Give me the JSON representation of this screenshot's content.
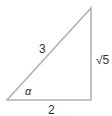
{
  "diagram": {
    "type": "right-triangle",
    "line_color": "#b3b3b3",
    "text_color": "#333333",
    "labels": {
      "hypotenuse": "3",
      "opposite": "√5",
      "adjacent": "2",
      "angle": "α"
    }
  }
}
